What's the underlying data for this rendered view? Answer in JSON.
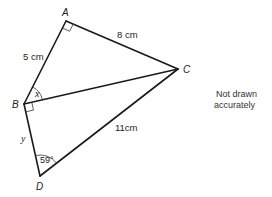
{
  "diagram": {
    "vertices": [
      {
        "id": "A",
        "label": "A"
      },
      {
        "id": "B",
        "label": "B"
      },
      {
        "id": "C",
        "label": "C"
      },
      {
        "id": "D",
        "label": "D"
      }
    ],
    "sides": {
      "AB": "5 cm",
      "AC": "8 cm",
      "CD": "11cm"
    },
    "angles": {
      "ABC": "x",
      "BDC": "59°",
      "BD_side": "y"
    },
    "right_angles": [
      "A",
      "B"
    ],
    "note_line1": "Not drawn",
    "note_line2": "accurately"
  }
}
